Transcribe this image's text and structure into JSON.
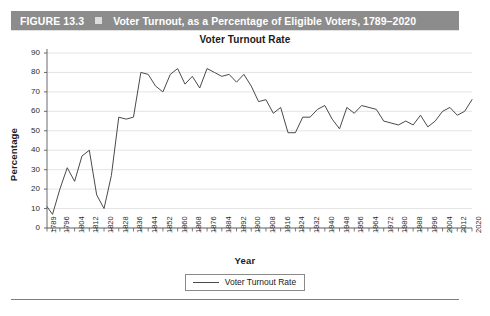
{
  "figure": {
    "number_label": "FIGURE 13.3",
    "marker_icon": "square-bullet-icon",
    "caption": "Voter Turnout, as a Percentage of Eligible Voters, 1789–2020",
    "bar_color": "#8c8c8c",
    "bar_text_color": "#ffffff"
  },
  "footer": {
    "source_note": ""
  },
  "chart_data": {
    "type": "line",
    "title": "Voter Turnout Rate",
    "xlabel": "Year",
    "ylabel": "Percentage",
    "ylim": [
      0,
      90
    ],
    "yticks": [
      0,
      10,
      20,
      30,
      40,
      50,
      60,
      70,
      80,
      90
    ],
    "grid": true,
    "legend_position": "bottom",
    "series_color": "#4a4a4a",
    "legend": [
      "Voter Turnout Rate"
    ],
    "xtick_labels": [
      "1789",
      "1796",
      "1804",
      "1812",
      "1820",
      "1828",
      "1836",
      "1844",
      "1852",
      "1860",
      "1868",
      "1876",
      "1884",
      "1892",
      "1900",
      "1908",
      "1916",
      "1924",
      "1932",
      "1940",
      "1948",
      "1956",
      "1964",
      "1972",
      "1980",
      "1988",
      "1996",
      "2004",
      "2012",
      "2020"
    ],
    "x": [
      1789,
      1792,
      1796,
      1800,
      1804,
      1808,
      1812,
      1816,
      1820,
      1824,
      1828,
      1832,
      1836,
      1840,
      1844,
      1848,
      1852,
      1856,
      1860,
      1864,
      1868,
      1872,
      1876,
      1880,
      1884,
      1888,
      1892,
      1896,
      1900,
      1904,
      1908,
      1912,
      1916,
      1920,
      1924,
      1928,
      1932,
      1936,
      1940,
      1944,
      1948,
      1952,
      1956,
      1960,
      1964,
      1968,
      1972,
      1976,
      1980,
      1984,
      1988,
      1992,
      1996,
      2000,
      2004,
      2008,
      2012,
      2016,
      2020
    ],
    "series": [
      {
        "name": "Voter Turnout Rate",
        "values": [
          11,
          7,
          20,
          31,
          24,
          37,
          40,
          17,
          10,
          27,
          57,
          56,
          57,
          80,
          79,
          73,
          70,
          79,
          82,
          74,
          78,
          72,
          82,
          80,
          78,
          79,
          75,
          79,
          73,
          65,
          66,
          59,
          62,
          49,
          49,
          57,
          57,
          61,
          63,
          56,
          51,
          62,
          59,
          63,
          62,
          61,
          55,
          54,
          53,
          55,
          53,
          58,
          52,
          55,
          60,
          62,
          58,
          60,
          66
        ]
      }
    ]
  }
}
